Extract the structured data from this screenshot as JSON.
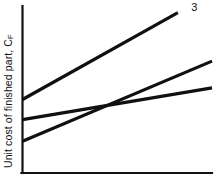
{
  "chart_data": {
    "type": "line",
    "title": "",
    "xlabel": "",
    "ylabel": "Unit cost of finished part, C",
    "ylabel_subscript": "F",
    "xlim": [
      0,
      100
    ],
    "ylim": [
      0,
      100
    ],
    "grid": false,
    "legend_position": "right-ends",
    "axes": {
      "x_axis_visible": true,
      "y_axis_visible": true,
      "ticks": [],
      "tick_labels": []
    },
    "series": [
      {
        "name": "1",
        "label": "1",
        "color": "#101010",
        "x": [
          0,
          100
        ],
        "y": [
          19,
          67
        ],
        "label_x": 107,
        "label_y": 70
      },
      {
        "name": "2",
        "label": "2",
        "color": "#101010",
        "x": [
          0,
          100
        ],
        "y": [
          32,
          51
        ],
        "label_x": 107,
        "label_y": 54
      },
      {
        "name": "3",
        "label": "3",
        "color": "#101010",
        "x": [
          0,
          82
        ],
        "y": [
          44,
          96
        ],
        "label_x": 89,
        "label_y": 99
      }
    ]
  }
}
